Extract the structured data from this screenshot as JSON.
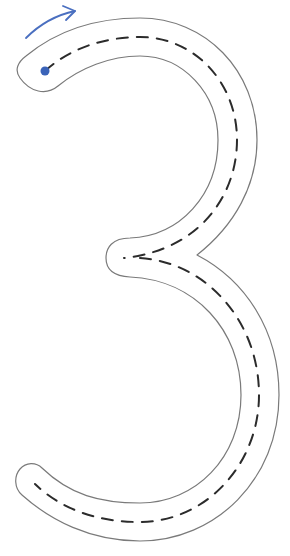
{
  "worksheet": {
    "glyph": "3",
    "glyph_label": "Number 3 tracing path",
    "colors": {
      "background": "#ffffff",
      "outline": "#7a7a7a",
      "guide_dash": "#2b2b2b",
      "start_marker": "#3a63b8",
      "direction_arrow": "#4a6fc0"
    },
    "start_marker": {
      "name": "start-dot",
      "cx": 45,
      "cy": 71,
      "r": 4.5
    },
    "direction_arrow": {
      "name": "direction-arrow",
      "from": [
        26,
        38
      ],
      "to": [
        75,
        10
      ]
    }
  }
}
